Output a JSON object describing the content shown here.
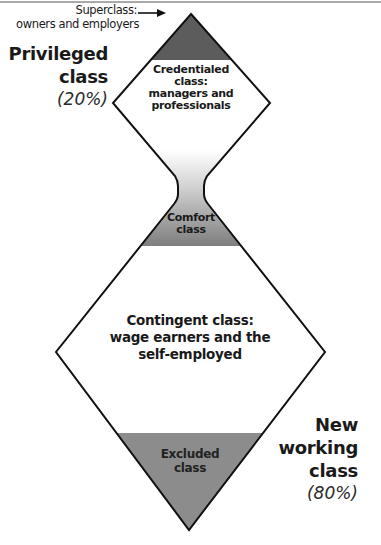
{
  "diagram": {
    "colors": {
      "line": "#111111",
      "dark_fill": "#5a5a5a",
      "mid_fill": "#8a8a8a",
      "gradient_light": "#ffffff",
      "background": "#ffffff"
    },
    "superclass": {
      "label_line1": "Superclass:",
      "label_line2": "owners and employers"
    },
    "privileged": {
      "line1": "Privileged",
      "line2": "class",
      "percent": "(20%)"
    },
    "credentialed": {
      "line1": "Credentialed",
      "line2": "class:",
      "line3": "managers and",
      "line4": "professionals"
    },
    "comfort": {
      "line1": "Comfort",
      "line2": "class"
    },
    "contingent": {
      "line1": "Contingent class:",
      "line2": "wage earners and the",
      "line3": "self-employed"
    },
    "excluded": {
      "line1": "Excluded",
      "line2": "class"
    },
    "new_working": {
      "line1": "New",
      "line2": "working",
      "line3": "class",
      "percent": "(80%)"
    }
  }
}
